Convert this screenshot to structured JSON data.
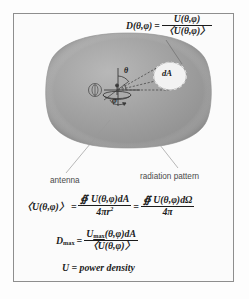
{
  "figure": {
    "background_color": "#fdfdfd",
    "frame_color": "#8e8e8e",
    "lobe_color": "#9a9a9a"
  },
  "equations": {
    "directivity": {
      "lhs": "D(θ,φ)",
      "equals": "=",
      "numerator": "U(θ,φ)",
      "denominator": "〈U(θ,φ)〉"
    },
    "average_power": {
      "lhs": "〈U(θ,φ)〉",
      "equals": "=",
      "numerator_1": "∯ U(θ,φ)dA",
      "denominator_1": "4πr",
      "denominator_1_exponent": "2",
      "equals_2": "=",
      "numerator_2": "∯ U(θ,φ)dΩ",
      "denominator_2": "4π"
    },
    "dmax": {
      "lhs_base": "D",
      "lhs_sub": "max",
      "equals": "=",
      "numerator_base": "U",
      "numerator_sub": "max",
      "numerator_rest": "(θ,φ)dA",
      "denominator": "〈U(θ,φ)〉"
    },
    "definition": "U = power density"
  },
  "labels": {
    "antenna": "antenna",
    "radiation_pattern": "radiation pattern",
    "dA": "dA",
    "theta": "θ",
    "phi": "φ"
  },
  "icons": {
    "lobe": "radiation-lobe-shape",
    "antenna": "dish-antenna-icon",
    "origin": "coordinate-origin-icon",
    "patch": "differential-area-patch-icon"
  }
}
